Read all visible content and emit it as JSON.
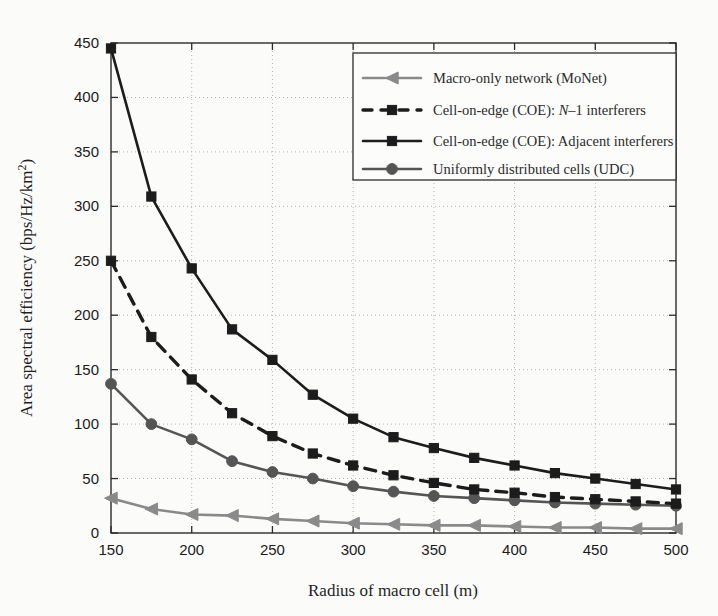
{
  "chart_data": {
    "type": "line",
    "title": "",
    "xlabel": "Radius of macro cell (m)",
    "ylabel": "Area spectral efficiency (bps/Hz/km²)",
    "xlim": [
      150,
      500
    ],
    "ylim": [
      0,
      450
    ],
    "xticks": [
      150,
      200,
      250,
      300,
      350,
      400,
      450,
      500
    ],
    "yticks": [
      0,
      50,
      100,
      150,
      200,
      250,
      300,
      350,
      400,
      450
    ],
    "grid": true,
    "grid_style": "dotted",
    "legend_position": "top-right",
    "x": [
      150,
      175,
      200,
      225,
      250,
      275,
      300,
      325,
      350,
      375,
      400,
      425,
      450,
      475,
      500
    ],
    "series": [
      {
        "name": "Macro-only network (MoNet)",
        "marker": "triangle-left",
        "linestyle": "solid",
        "color": "#8a8a8a",
        "values": [
          32,
          22,
          17,
          16,
          13,
          11,
          9,
          8,
          7,
          7,
          6,
          5,
          5,
          4,
          4
        ]
      },
      {
        "name": "Cell-on-edge (COE): N–1 interferers",
        "marker": "square",
        "linestyle": "dashed",
        "color": "#1c1c1c",
        "values": [
          250,
          180,
          141,
          110,
          89,
          73,
          62,
          53,
          46,
          40,
          37,
          33,
          31,
          29,
          27
        ]
      },
      {
        "name": "Cell-on-edge (COE): Adjacent interferers",
        "marker": "square",
        "linestyle": "solid",
        "color": "#1c1c1c",
        "values": [
          445,
          309,
          243,
          187,
          159,
          127,
          105,
          88,
          78,
          69,
          62,
          55,
          50,
          45,
          40
        ]
      },
      {
        "name": "Uniformly distributed cells (UDC)",
        "marker": "circle",
        "linestyle": "solid",
        "color": "#555555",
        "values": [
          137,
          100,
          86,
          66,
          56,
          50,
          43,
          38,
          34,
          32,
          30,
          28,
          27,
          26,
          25
        ]
      }
    ]
  },
  "legend": {
    "entries": [
      {
        "label": "Macro-only network (MoNet)",
        "label_pre": "Macro-only network (MoNet)",
        "label_italic": "",
        "label_post": ""
      },
      {
        "label": "Cell-on-edge (COE): N–1 interferers",
        "label_pre": "Cell-on-edge (COE): ",
        "label_italic": "N",
        "label_post": "–1 interferers"
      },
      {
        "label": "Cell-on-edge (COE): Adjacent interferers",
        "label_pre": "Cell-on-edge (COE): Adjacent interferers",
        "label_italic": "",
        "label_post": ""
      },
      {
        "label": "Uniformly distributed cells (UDC)",
        "label_pre": "Uniformly distributed cells (UDC)",
        "label_italic": "",
        "label_post": ""
      }
    ]
  },
  "axes": {
    "xlabel": "Radius of macro cell (m)",
    "ylabel_pre": "Area spectral efficiency (bps/Hz/km",
    "ylabel_sup": "2",
    "ylabel_post": ")",
    "xtick_labels": [
      "150",
      "200",
      "250",
      "300",
      "350",
      "400",
      "450",
      "500"
    ],
    "ytick_labels": [
      "0",
      "50",
      "100",
      "150",
      "200",
      "250",
      "300",
      "350",
      "400",
      "450"
    ]
  },
  "colors": {
    "background": "#fbfbfa",
    "axis": "#2b2b2b",
    "grid": "#b9b3b0",
    "monet": "#8a8a8a",
    "coe": "#1c1c1c",
    "udc": "#555555"
  }
}
